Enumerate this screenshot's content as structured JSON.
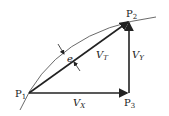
{
  "diagram": {
    "points": {
      "p1": {
        "label": "P",
        "sub": "1"
      },
      "p2": {
        "label": "P",
        "sub": "2"
      },
      "p3": {
        "label": "P",
        "sub": "3"
      }
    },
    "vectors": {
      "vt": {
        "label": "V",
        "sub": "T"
      },
      "vx": {
        "label": "V",
        "sub": "X"
      },
      "vy": {
        "label": "V",
        "sub": "Y"
      }
    },
    "error": {
      "label": "e"
    }
  }
}
